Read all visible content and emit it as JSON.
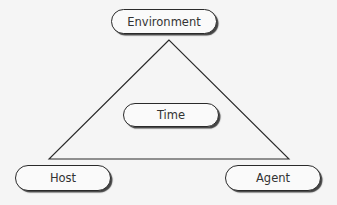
{
  "diagram": {
    "type": "epidemiological-triangle",
    "nodes": {
      "top": "Environment",
      "center": "Time",
      "bottom_left": "Host",
      "bottom_right": "Agent"
    },
    "edges": [
      [
        "Environment",
        "Host"
      ],
      [
        "Host",
        "Agent"
      ],
      [
        "Agent",
        "Environment"
      ]
    ],
    "colors": {
      "background": "#f5f5f5",
      "stroke": "#2a2a2a",
      "text": "#333333"
    }
  }
}
